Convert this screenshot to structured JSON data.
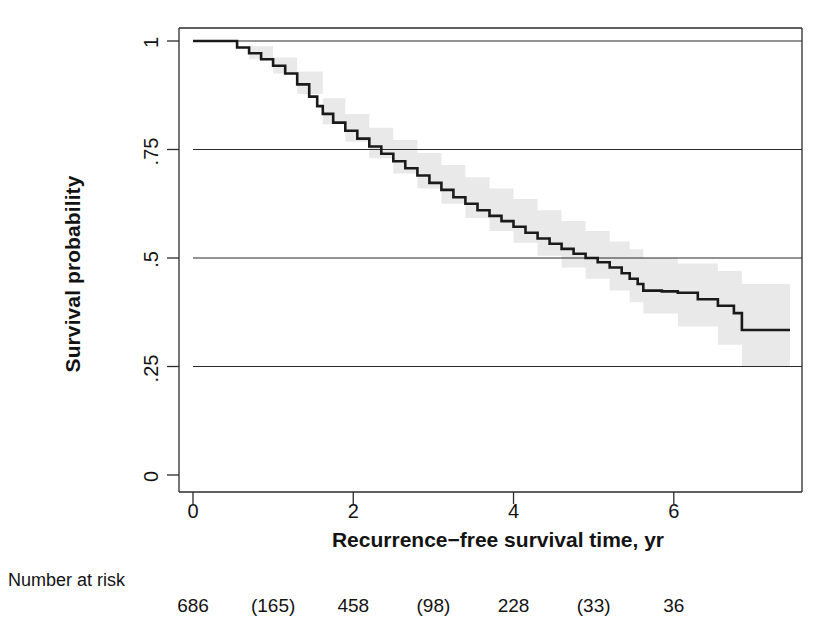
{
  "chart_data": {
    "type": "line",
    "title": "",
    "xlabel": "Recurrence−free survival time, yr",
    "ylabel": "Survival probability",
    "xlim": [
      0,
      7.6
    ],
    "ylim": [
      0,
      1
    ],
    "grid": "horizontal",
    "legend": "none",
    "xticks": [
      0,
      2,
      4,
      6
    ],
    "xtick_labels": [
      "0",
      "2",
      "4",
      "6"
    ],
    "yticks": [
      0,
      0.25,
      0.5,
      0.75,
      1
    ],
    "ytick_labels": [
      "0",
      ".25",
      ".5",
      ".75",
      "1"
    ],
    "series": [
      {
        "name": "Kaplan-Meier survival estimate",
        "style": "step",
        "color": "#1a1a1a",
        "x": [
          0,
          0.42,
          0.55,
          0.7,
          0.85,
          1.0,
          1.15,
          1.3,
          1.45,
          1.55,
          1.62,
          1.75,
          1.9,
          2.05,
          2.2,
          2.35,
          2.5,
          2.65,
          2.8,
          2.95,
          3.1,
          3.25,
          3.4,
          3.55,
          3.7,
          3.85,
          4.0,
          4.15,
          4.3,
          4.45,
          4.6,
          4.75,
          4.9,
          5.05,
          5.2,
          5.35,
          5.45,
          5.55,
          5.62,
          5.85,
          6.05,
          6.3,
          6.55,
          6.75,
          6.85,
          7.45
        ],
        "y": [
          1.0,
          1.0,
          0.985,
          0.972,
          0.958,
          0.943,
          0.925,
          0.9,
          0.872,
          0.85,
          0.832,
          0.812,
          0.793,
          0.775,
          0.757,
          0.74,
          0.723,
          0.707,
          0.69,
          0.673,
          0.657,
          0.64,
          0.625,
          0.61,
          0.597,
          0.585,
          0.572,
          0.558,
          0.545,
          0.533,
          0.521,
          0.51,
          0.5,
          0.49,
          0.478,
          0.465,
          0.452,
          0.44,
          0.425,
          0.423,
          0.42,
          0.405,
          0.39,
          0.373,
          0.334,
          0.334
        ]
      }
    ],
    "confidence_band": {
      "name": "95% confidence interval",
      "color": "#e8e8e8",
      "x": [
        0,
        0.42,
        0.7,
        1.0,
        1.3,
        1.62,
        1.9,
        2.2,
        2.5,
        2.8,
        3.1,
        3.4,
        3.7,
        4.0,
        4.3,
        4.6,
        4.9,
        5.2,
        5.45,
        5.62,
        6.05,
        6.55,
        6.85,
        7.45
      ],
      "lower": [
        1.0,
        1.0,
        0.958,
        0.925,
        0.878,
        0.808,
        0.768,
        0.73,
        0.695,
        0.66,
        0.625,
        0.592,
        0.562,
        0.535,
        0.505,
        0.478,
        0.452,
        0.425,
        0.398,
        0.372,
        0.342,
        0.3,
        0.25,
        0.25
      ],
      "upper": [
        1.0,
        1.0,
        0.988,
        0.962,
        0.93,
        0.868,
        0.832,
        0.8,
        0.772,
        0.742,
        0.714,
        0.686,
        0.66,
        0.636,
        0.61,
        0.585,
        0.562,
        0.538,
        0.52,
        0.5,
        0.487,
        0.47,
        0.44,
        0.44
      ]
    },
    "number_at_risk": {
      "label": "Number at risk",
      "x": [
        0,
        1,
        2,
        3,
        4,
        5,
        6
      ],
      "values": [
        "686",
        "(165)",
        "458",
        "(98)",
        "228",
        "(33)",
        "36"
      ]
    }
  }
}
